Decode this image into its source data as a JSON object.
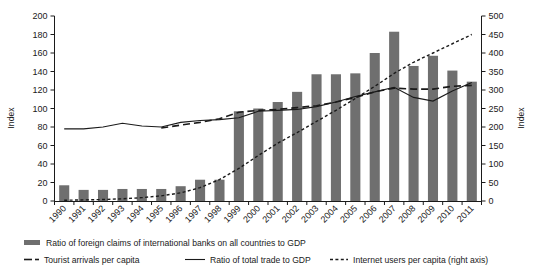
{
  "chart_data": {
    "type": "bar",
    "title": "",
    "subtitle": "",
    "xlabel": "",
    "ylabel": "Index",
    "ylabel_right": "Index",
    "ylim": [
      0,
      200
    ],
    "ylim_right": [
      0,
      500
    ],
    "ytick_step": 20,
    "ytick_step_right": 50,
    "grid": false,
    "legend_position": "bottom",
    "categories": [
      "1990",
      "1991",
      "1992",
      "1993",
      "1994",
      "1995",
      "1996",
      "1997",
      "1998",
      "1999",
      "2000",
      "2001",
      "2002",
      "2003",
      "2004",
      "2005",
      "2006",
      "2007",
      "2008",
      "2009",
      "2010",
      "2011"
    ],
    "yticks": [
      "0",
      "20",
      "40",
      "60",
      "80",
      "100",
      "120",
      "140",
      "160",
      "180",
      "200"
    ],
    "yticks_right": [
      "0",
      "50",
      "100",
      "150",
      "200",
      "250",
      "300",
      "350",
      "400",
      "450",
      "500"
    ],
    "series": [
      {
        "name": "Ratio of foreign claims of international banks on all countries to GDP",
        "type": "bar",
        "axis": "left",
        "color": "#6f6f6f",
        "values": [
          17,
          12,
          12,
          13,
          13,
          13,
          16,
          23,
          23,
          97,
          100,
          107,
          118,
          137,
          137,
          138,
          160,
          183,
          146,
          157,
          141,
          129
        ]
      },
      {
        "name": "Tourist arrivals per capita",
        "type": "line",
        "style": "dashed",
        "axis": "left",
        "color": "#1a1a1a",
        "values": [
          null,
          null,
          null,
          null,
          null,
          79,
          82,
          85,
          89,
          96,
          98,
          99,
          101,
          103,
          107,
          112,
          118,
          122,
          121,
          121,
          124,
          125
        ]
      },
      {
        "name": "Ratio of total trade to GDP",
        "type": "line",
        "style": "solid",
        "axis": "left",
        "color": "#1a1a1a",
        "values": [
          78,
          78,
          80,
          84,
          81,
          80,
          85,
          87,
          88,
          90,
          97,
          98,
          99,
          102,
          107,
          113,
          118,
          123,
          112,
          108,
          119,
          128
        ]
      },
      {
        "name": "Internet users per capita (right axis)",
        "type": "line",
        "style": "dotted",
        "axis": "right",
        "color": "#1a1a1a",
        "values": [
          2,
          3,
          4,
          6,
          9,
          14,
          22,
          36,
          58,
          88,
          123,
          156,
          185,
          215,
          245,
          277,
          310,
          345,
          375,
          400,
          425,
          450
        ]
      }
    ],
    "annotations": []
  },
  "legend": {
    "items": [
      {
        "label": "Ratio of foreign claims of international banks on all countries to GDP",
        "marker": "bar-swatch-icon"
      },
      {
        "label": "Tourist arrivals per capita",
        "marker": "dashed-line-icon"
      },
      {
        "label": "Ratio of total trade to GDP",
        "marker": "solid-line-icon"
      },
      {
        "label": "Internet users per capita (right axis)",
        "marker": "dotted-line-icon"
      }
    ]
  }
}
